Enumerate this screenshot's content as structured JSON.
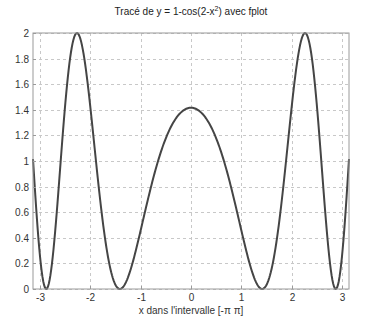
{
  "chart_data": {
    "type": "line",
    "title_parts": {
      "prefix": "Tracé de y = 1-cos(2-x",
      "sup": "2",
      "suffix": ") avec fplot"
    },
    "xlabel": "x dans l'intervalle [-π π]",
    "ylabel": "",
    "xlim": [
      -3.14159,
      3.14159
    ],
    "ylim": [
      0,
      2
    ],
    "grid": true,
    "legend": null,
    "x_ticks": [
      -3,
      -2,
      -1,
      0,
      1,
      2,
      3
    ],
    "x_tick_labels": [
      "-3",
      "-2",
      "-1",
      "0",
      "1",
      "2",
      "3"
    ],
    "y_ticks": [
      0,
      0.2,
      0.4,
      0.6,
      0.8,
      1,
      1.2,
      1.4,
      1.6,
      1.8,
      2
    ],
    "y_tick_labels": [
      "0",
      "0.2",
      "0.4",
      "0.6",
      "0.8",
      "1",
      "1.2",
      "1.4",
      "1.6",
      "1.8",
      "2"
    ],
    "series": [
      {
        "name": "y = 1-cos(2-x^2)",
        "function": "1-cos(2-x^2)",
        "x": [
          -3.1416,
          -3.0,
          -2.9,
          -2.8,
          -2.7,
          -2.6,
          -2.5,
          -2.4,
          -2.3,
          -2.2,
          -2.1,
          -2.0,
          -1.9,
          -1.8,
          -1.7,
          -1.6,
          -1.5,
          -1.4142,
          -1.3,
          -1.2,
          -1.1,
          -1.0,
          -0.9,
          -0.8,
          -0.7,
          -0.6,
          -0.5,
          -0.4,
          -0.3,
          -0.2,
          -0.1,
          0.0,
          0.1,
          0.2,
          0.3,
          0.4,
          0.5,
          0.6,
          0.7,
          0.8,
          0.9,
          1.0,
          1.1,
          1.2,
          1.3,
          1.4142,
          1.5,
          1.6,
          1.7,
          1.8,
          1.9,
          2.0,
          2.1,
          2.2,
          2.3,
          2.4,
          2.5,
          2.6,
          2.7,
          2.8,
          2.9,
          3.0,
          3.1416
        ],
        "values": [
          1.02,
          0.44,
          0.04,
          0.12,
          0.55,
          1.1,
          1.56,
          1.89,
          2.0,
          1.93,
          1.72,
          1.42,
          1.08,
          0.77,
          0.49,
          0.26,
          0.1,
          0.0,
          0.05,
          0.23,
          0.49,
          0.75,
          1.0,
          1.19,
          1.32,
          1.4,
          1.43,
          1.43,
          1.42,
          1.42,
          1.42,
          1.42,
          1.42,
          1.42,
          1.42,
          1.43,
          1.43,
          1.4,
          1.32,
          1.19,
          1.0,
          0.75,
          0.49,
          0.23,
          0.05,
          0.0,
          0.1,
          0.26,
          0.49,
          0.77,
          1.08,
          1.42,
          1.72,
          1.93,
          2.0,
          1.89,
          1.56,
          1.1,
          0.55,
          0.12,
          0.04,
          0.44,
          1.02
        ],
        "color": "#454545"
      }
    ],
    "colors": {
      "curve": "#454545",
      "grid": "#c8c8c8",
      "axes": "#9a9a9a",
      "text": "#333333"
    }
  }
}
